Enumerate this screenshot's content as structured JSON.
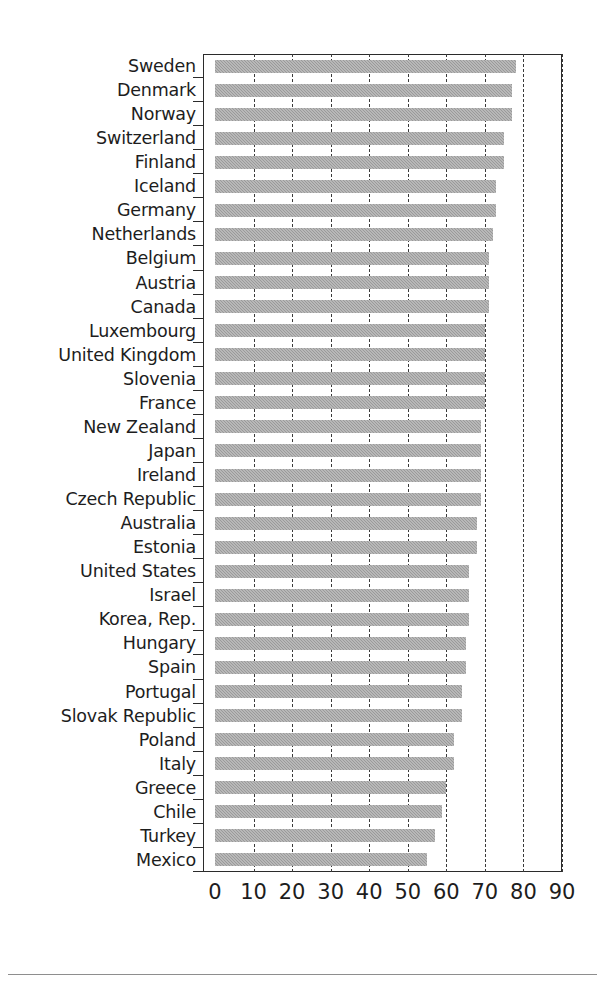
{
  "chart_data": {
    "type": "bar",
    "orientation": "horizontal",
    "title": "",
    "subtitle": "",
    "xlabel": "",
    "ylabel": "",
    "xlim": [
      0,
      90
    ],
    "xticks": [
      0,
      10,
      20,
      30,
      40,
      50,
      60,
      70,
      80,
      90
    ],
    "xtick_labels": [
      "0",
      "10",
      "20",
      "30",
      "40",
      "50",
      "60",
      "70",
      "80",
      "90"
    ],
    "grid": "vertical-dashed",
    "legend": "none",
    "bar_color": "#9a9a9a",
    "categories": [
      "Sweden",
      "Denmark",
      "Norway",
      "Switzerland",
      "Finland",
      "Iceland",
      "Germany",
      "Netherlands",
      "Belgium",
      "Austria",
      "Canada",
      "Luxembourg",
      "United Kingdom",
      "Slovenia",
      "France",
      "New Zealand",
      "Japan",
      "Ireland",
      "Czech Republic",
      "Australia",
      "Estonia",
      "United States",
      "Israel",
      "Korea, Rep.",
      "Hungary",
      "Spain",
      "Portugal",
      "Slovak Republic",
      "Poland",
      "Italy",
      "Greece",
      "Chile",
      "Turkey",
      "Mexico"
    ],
    "values": [
      78,
      77,
      77,
      75,
      75,
      73,
      73,
      72,
      71,
      71,
      71,
      70,
      70,
      70,
      70,
      69,
      69,
      69,
      69,
      68,
      68,
      66,
      66,
      66,
      65,
      65,
      64,
      64,
      62,
      62,
      60,
      59,
      57,
      55
    ]
  },
  "axis": {
    "x_tick_labels": [
      "0",
      "10",
      "20",
      "30",
      "40",
      "50",
      "60",
      "70",
      "80",
      "90"
    ]
  }
}
